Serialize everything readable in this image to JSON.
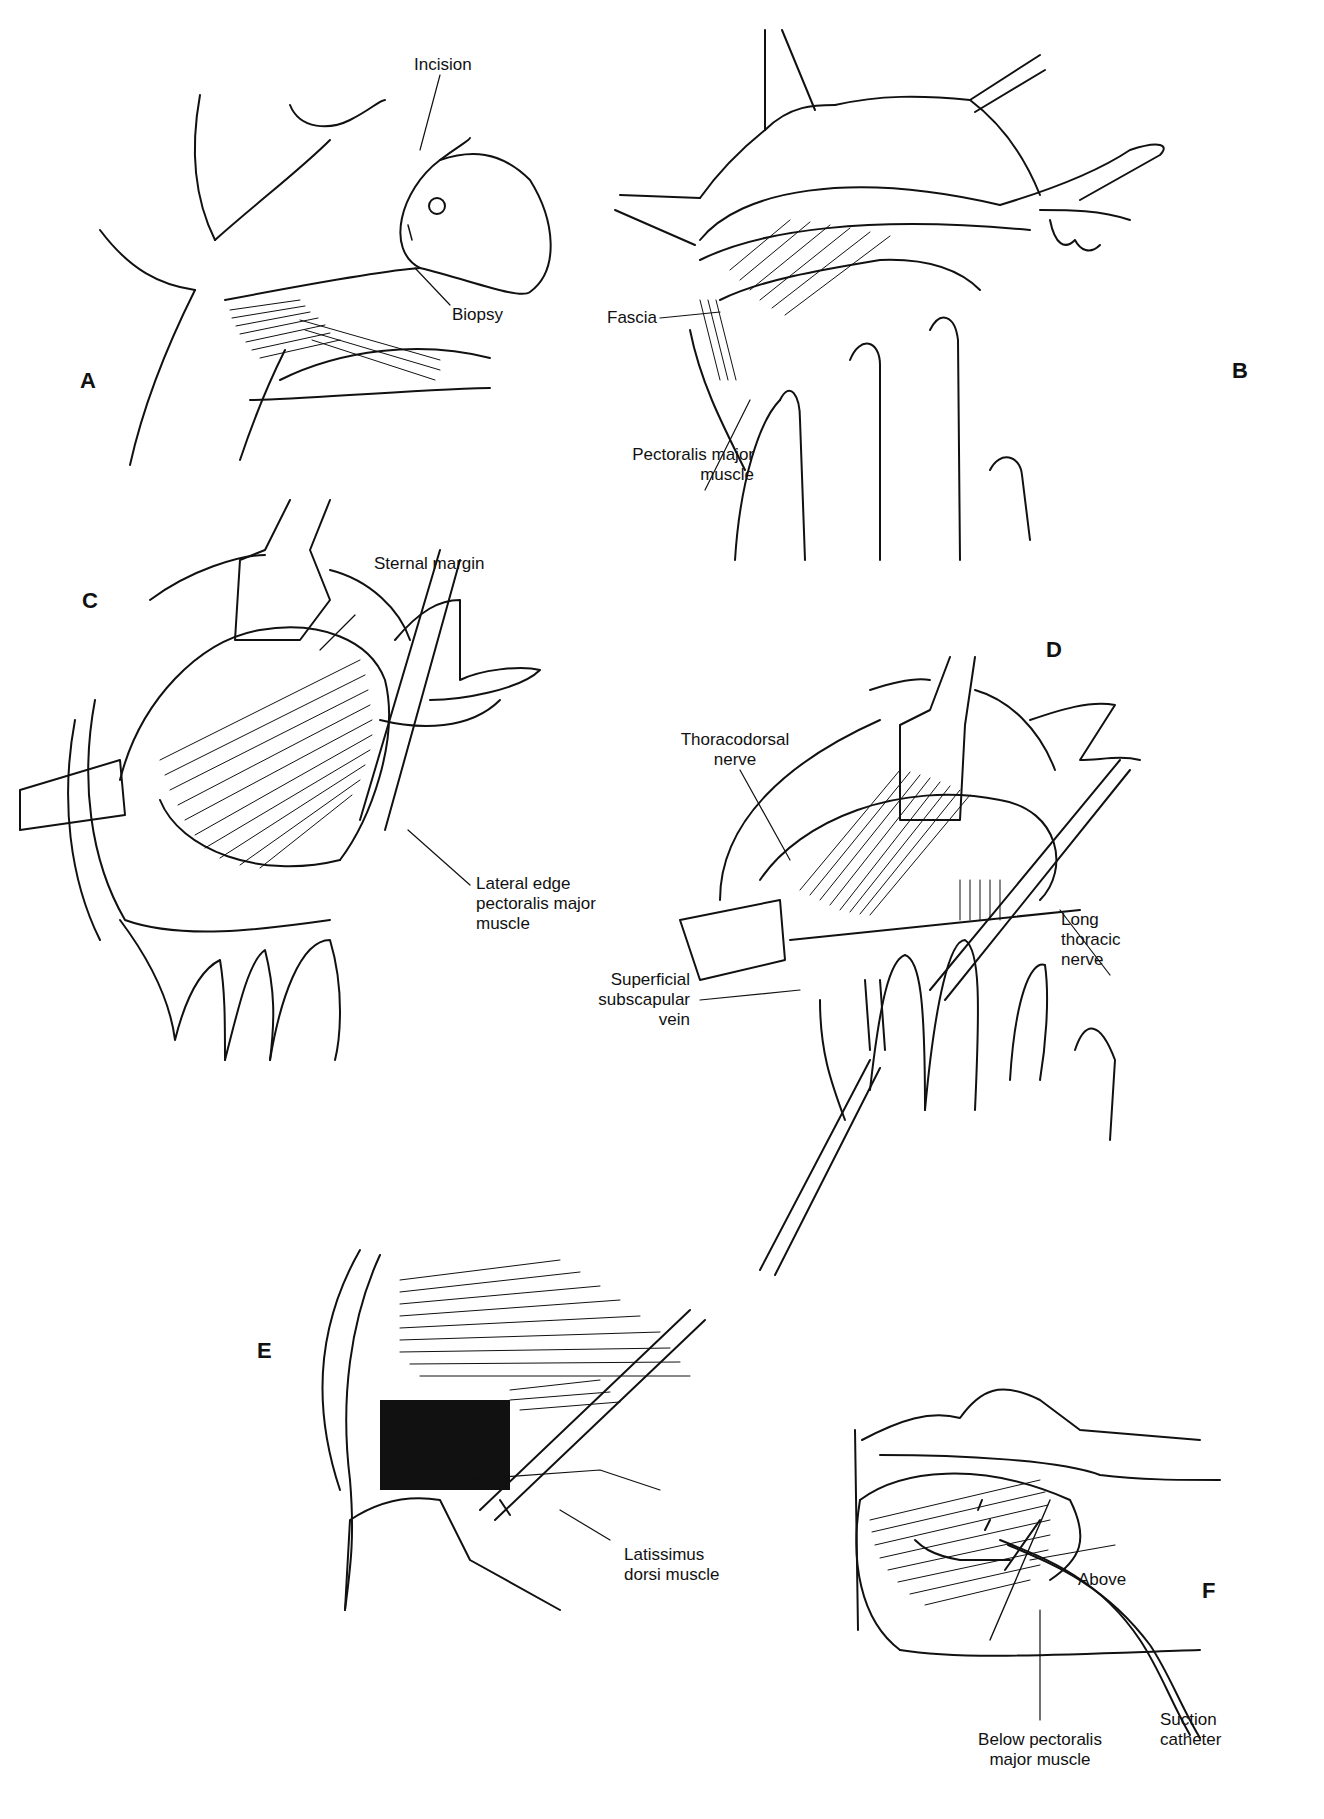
{
  "figure": {
    "panels": [
      {
        "id": "A",
        "letter": "A",
        "labels": [
          "Incision",
          "Biopsy"
        ]
      },
      {
        "id": "B",
        "letter": "B",
        "labels": [
          "Fascia",
          "Pectoralis major",
          "muscle"
        ]
      },
      {
        "id": "C",
        "letter": "C",
        "labels": [
          "Sternal margin",
          "Lateral edge",
          "pectoralis major",
          "muscle"
        ]
      },
      {
        "id": "D",
        "letter": "D",
        "labels": [
          "Thoracodorsal",
          "nerve",
          "Superficial",
          "subscapular",
          "vein",
          "Long",
          "thoracic",
          "nerve"
        ]
      },
      {
        "id": "E",
        "letter": "E",
        "labels": [
          "Latissimus",
          "dorsi muscle"
        ]
      },
      {
        "id": "F",
        "letter": "F",
        "labels": [
          "Above",
          "Below pectoralis",
          "major muscle",
          "Suction",
          "catheter"
        ]
      }
    ]
  },
  "colors": {
    "ink": "#111111",
    "background": "#ffffff"
  }
}
